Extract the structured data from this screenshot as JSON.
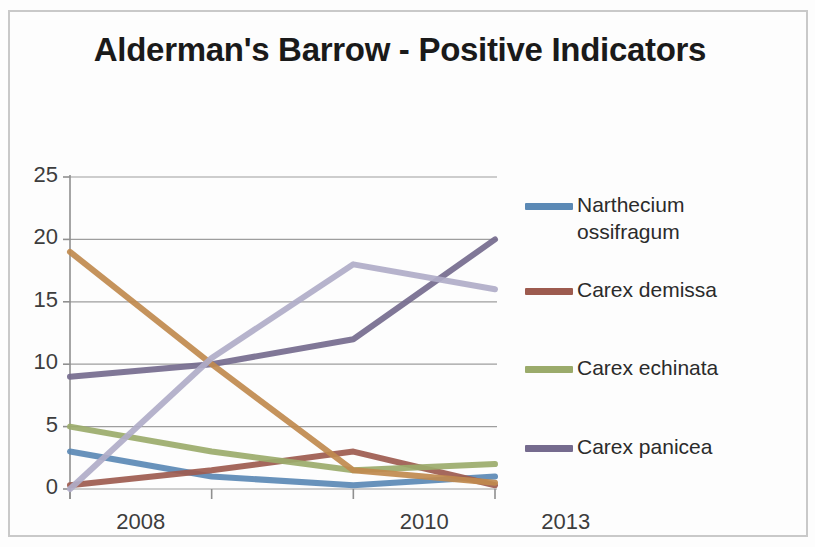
{
  "title": "Alderman's Barrow - Positive Indicators",
  "legend": {
    "entries": [
      {
        "label": "Narthecium ossifragum",
        "color": "#5B89B5"
      },
      {
        "label": "Carex demissa",
        "color": "#9D5B4F"
      },
      {
        "label": "Carex echinata",
        "color": "#9BAB6B"
      },
      {
        "label": "Carex panicea",
        "color": "#756B8E"
      }
    ]
  },
  "chart_data": {
    "type": "line",
    "title": "Alderman's Barrow - Positive Indicators",
    "xlabel": "",
    "ylabel": "",
    "categories": [
      "2008",
      "",
      "2010",
      "2013"
    ],
    "tick_labels_x": [
      "2008",
      "2010",
      "2013"
    ],
    "tick_labels_y": [
      "0",
      "5",
      "10",
      "15",
      "20",
      "25"
    ],
    "ylim": [
      0,
      25
    ],
    "ytick_step": 5,
    "grid": true,
    "grid_axis": "y",
    "legend_position": "right",
    "series": [
      {
        "name": "Narthecium ossifragum",
        "color": "#5B89B5",
        "values": [
          3,
          1,
          0.3,
          1
        ]
      },
      {
        "name": "Carex demissa",
        "color": "#9D5B4F",
        "values": [
          0.3,
          1.5,
          3,
          0.3
        ]
      },
      {
        "name": "Carex echinata",
        "color": "#9BAB6B",
        "values": [
          5,
          3,
          1.5,
          2
        ]
      },
      {
        "name": "Carex panicea",
        "color": "#756B8E",
        "values": [
          9,
          10,
          12,
          20
        ]
      },
      {
        "name": "",
        "color": "#C08A4E",
        "values": [
          19,
          10,
          1.5,
          0.5
        ]
      },
      {
        "name": "",
        "color": "#B0ADC8",
        "values": [
          0,
          10.5,
          18,
          16
        ]
      }
    ]
  }
}
